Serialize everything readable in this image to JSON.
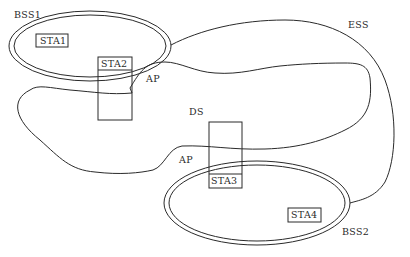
{
  "diagram": {
    "type": "IEEE 802.11 ESS network topology",
    "colors": {
      "line": "#2a2a2a",
      "background": "#ffffff"
    },
    "bss1": {
      "label": "BSS1"
    },
    "bss2": {
      "label": "BSS2"
    },
    "ess": {
      "label": "ESS"
    },
    "ds": {
      "label": "DS"
    },
    "ap_labels": [
      "AP",
      "AP"
    ],
    "stations": [
      {
        "id": "sta1",
        "label": "STA1",
        "in": "BSS1"
      },
      {
        "id": "sta2",
        "label": "STA2",
        "in": "BSS1",
        "role": "AP"
      },
      {
        "id": "sta3",
        "label": "STA3",
        "in": "BSS2",
        "role": "AP"
      },
      {
        "id": "sta4",
        "label": "STA4",
        "in": "BSS2"
      }
    ]
  }
}
